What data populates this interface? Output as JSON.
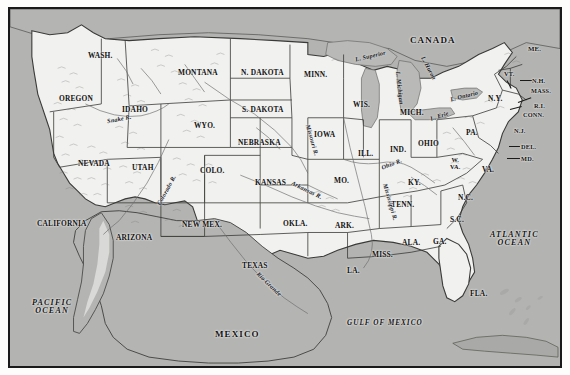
{
  "figure": {
    "frame_color": "#1a1a1a",
    "land_color": "#f1f1ef",
    "water_color": "#b3b3b1",
    "page_color": "#fdfdfc"
  },
  "countries": [
    {
      "name": "canada-label",
      "label": "CANADA",
      "x": 400,
      "y": 27
    },
    {
      "name": "mexico-label",
      "label": "MEXICO",
      "x": 205,
      "y": 321
    }
  ],
  "oceans": [
    {
      "name": "pacific-ocean-label",
      "label": "PACIFIC\nOCEAN",
      "x": 22,
      "y": 290,
      "size": "lg"
    },
    {
      "name": "atlantic-ocean-label",
      "label": "ATLANTIC\nOCEAN",
      "x": 480,
      "y": 222,
      "size": "lg"
    },
    {
      "name": "gulf-of-mexico-label",
      "label": "GULF OF MEXICO",
      "x": 337,
      "y": 311,
      "size": "sm"
    }
  ],
  "lakes": [
    {
      "name": "lake-superior-label",
      "label": "L. Superior",
      "x": 345,
      "y": 44,
      "rot": -13
    },
    {
      "name": "lake-michigan-label",
      "label": "L. Michigan",
      "x": 373,
      "y": 76,
      "rot": 84
    },
    {
      "name": "lake-huron-label",
      "label": "L. Huron",
      "x": 406,
      "y": 56,
      "rot": 62
    },
    {
      "name": "lake-ontario-label",
      "label": "L. Ontario",
      "x": 440,
      "y": 84,
      "rot": -14
    },
    {
      "name": "lake-erie-label",
      "label": "L. Erie",
      "x": 420,
      "y": 104,
      "rot": -18
    }
  ],
  "rivers": [
    {
      "name": "snake-river-label",
      "label": "Snake  R.",
      "x": 97,
      "y": 107,
      "rot": -11
    },
    {
      "name": "colorado-river-label",
      "label": "Colorado  R.",
      "x": 140,
      "y": 178,
      "rot": -61
    },
    {
      "name": "missouri-river-label",
      "label": "Missouri R.",
      "x": 286,
      "y": 128,
      "rot": 74
    },
    {
      "name": "arkansas-river-label",
      "label": "Arkansas R.",
      "x": 280,
      "y": 178,
      "rot": 26
    },
    {
      "name": "mississippi-river-label",
      "label": "Mississippi R.",
      "x": 361,
      "y": 190,
      "rot": 74
    },
    {
      "name": "ohio-river-label",
      "label": "Ohio R.",
      "x": 371,
      "y": 152,
      "rot": -22
    },
    {
      "name": "rio-grande-label",
      "label": "Rio Grande",
      "x": 243,
      "y": 272,
      "rot": 44
    }
  ],
  "states": [
    {
      "name": "state-washington",
      "label": "WASH.",
      "x": 78,
      "y": 43,
      "size": "md"
    },
    {
      "name": "state-oregon",
      "label": "OREGON",
      "x": 49,
      "y": 86,
      "size": "md"
    },
    {
      "name": "state-idaho",
      "label": "IDAHO",
      "x": 112,
      "y": 97,
      "size": "md"
    },
    {
      "name": "state-montana",
      "label": "MONTANA",
      "x": 168,
      "y": 60,
      "size": "md"
    },
    {
      "name": "state-wyoming",
      "label": "WYO.",
      "x": 184,
      "y": 113,
      "size": "md"
    },
    {
      "name": "state-north-dakota",
      "label": "N. DAKOTA",
      "x": 231,
      "y": 60,
      "size": "md"
    },
    {
      "name": "state-south-dakota",
      "label": "S. DAKOTA",
      "x": 232,
      "y": 97,
      "size": "md"
    },
    {
      "name": "state-minnesota",
      "label": "MINN.",
      "x": 294,
      "y": 62,
      "size": "md"
    },
    {
      "name": "state-nebraska",
      "label": "NEBRASKA",
      "x": 228,
      "y": 130,
      "size": "md"
    },
    {
      "name": "state-iowa",
      "label": "IOWA",
      "x": 304,
      "y": 122,
      "size": "md"
    },
    {
      "name": "state-wisconsin",
      "label": "WIS.",
      "x": 343,
      "y": 92,
      "size": "md"
    },
    {
      "name": "state-michigan",
      "label": "MICH.",
      "x": 390,
      "y": 100,
      "size": "md"
    },
    {
      "name": "state-illinois",
      "label": "ILL.",
      "x": 348,
      "y": 141,
      "size": "md"
    },
    {
      "name": "state-indiana",
      "label": "IND.",
      "x": 380,
      "y": 137,
      "size": "md"
    },
    {
      "name": "state-ohio",
      "label": "OHIO",
      "x": 408,
      "y": 131,
      "size": "md"
    },
    {
      "name": "state-nevada",
      "label": "NEVADA",
      "x": 68,
      "y": 151,
      "size": "md"
    },
    {
      "name": "state-utah",
      "label": "UTAH",
      "x": 122,
      "y": 155,
      "size": "md"
    },
    {
      "name": "state-colorado",
      "label": "COLO.",
      "x": 190,
      "y": 158,
      "size": "md"
    },
    {
      "name": "state-kansas",
      "label": "KANSAS",
      "x": 245,
      "y": 170,
      "size": "md"
    },
    {
      "name": "state-missouri",
      "label": "MO.",
      "x": 324,
      "y": 168,
      "size": "md"
    },
    {
      "name": "state-kentucky",
      "label": "KY.",
      "x": 398,
      "y": 170,
      "size": "md"
    },
    {
      "name": "state-california",
      "label": "CALIFORNIA",
      "x": 27,
      "y": 211,
      "size": "md"
    },
    {
      "name": "state-arizona",
      "label": "ARIZONA",
      "x": 106,
      "y": 225,
      "size": "md"
    },
    {
      "name": "state-new-mexico",
      "label": "NEW MEX.",
      "x": 172,
      "y": 212,
      "size": "md"
    },
    {
      "name": "state-oklahoma",
      "label": "OKLA.",
      "x": 273,
      "y": 211,
      "size": "md"
    },
    {
      "name": "state-arkansas",
      "label": "ARK.",
      "x": 325,
      "y": 213,
      "size": "md"
    },
    {
      "name": "state-tennessee",
      "label": "TENN.",
      "x": 381,
      "y": 192,
      "size": "md"
    },
    {
      "name": "state-texas",
      "label": "TEXAS",
      "x": 232,
      "y": 253,
      "size": "md"
    },
    {
      "name": "state-louisiana",
      "label": "LA.",
      "x": 337,
      "y": 258,
      "size": "md"
    },
    {
      "name": "state-mississippi",
      "label": "MISS.",
      "x": 362,
      "y": 242,
      "size": "md"
    },
    {
      "name": "state-alabama",
      "label": "ALA.",
      "x": 392,
      "y": 230,
      "size": "md"
    },
    {
      "name": "state-georgia",
      "label": "GA.",
      "x": 423,
      "y": 229,
      "size": "md"
    },
    {
      "name": "state-florida",
      "label": "FLA.",
      "x": 460,
      "y": 281,
      "size": "md"
    },
    {
      "name": "state-south-carolina",
      "label": "S.C.",
      "x": 440,
      "y": 207,
      "size": "md"
    },
    {
      "name": "state-north-carolina",
      "label": "N.C.",
      "x": 448,
      "y": 185,
      "size": "md"
    },
    {
      "name": "state-virginia",
      "label": "VA.",
      "x": 472,
      "y": 157,
      "size": "md"
    },
    {
      "name": "state-pennsylvania",
      "label": "PA.",
      "x": 456,
      "y": 120,
      "size": "md"
    },
    {
      "name": "state-new-york",
      "label": "N.Y.",
      "x": 478,
      "y": 86,
      "size": "md"
    },
    {
      "name": "state-maine",
      "label": "ME.",
      "x": 518,
      "y": 37,
      "size": "sm"
    },
    {
      "name": "state-vermont",
      "label": "VT.",
      "x": 494,
      "y": 62,
      "size": "xs"
    },
    {
      "name": "state-new-hampshire",
      "label": "N.H.",
      "x": 522,
      "y": 69,
      "size": "xs"
    },
    {
      "name": "state-massachusetts",
      "label": "MASS.",
      "x": 521,
      "y": 79,
      "size": "xs"
    },
    {
      "name": "state-rhode-island",
      "label": "R.I.",
      "x": 524,
      "y": 94,
      "size": "xs"
    },
    {
      "name": "state-connecticut",
      "label": "CONN.",
      "x": 513,
      "y": 103,
      "size": "xs"
    },
    {
      "name": "state-new-jersey",
      "label": "N.J.",
      "x": 504,
      "y": 119,
      "size": "xs"
    },
    {
      "name": "state-delaware",
      "label": "DEL.",
      "x": 511,
      "y": 135,
      "size": "xs"
    },
    {
      "name": "state-maryland",
      "label": "MD.",
      "x": 511,
      "y": 147,
      "size": "xs"
    }
  ],
  "state_two_line": [
    {
      "name": "state-west-virginia",
      "label": "W.\nVA.",
      "x": 440,
      "y": 148
    }
  ]
}
